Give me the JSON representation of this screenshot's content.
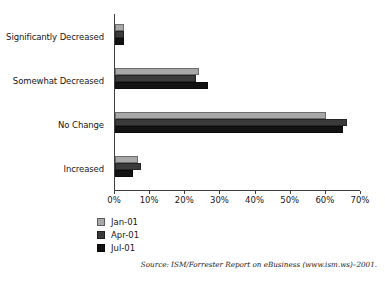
{
  "title_remnant": "________________________________________________",
  "chart_data": {
    "type": "bar",
    "orientation": "horizontal",
    "title": "",
    "xlabel": "",
    "ylabel": "",
    "xlim": [
      0,
      70
    ],
    "grid": false,
    "legend_position": "bottom-left",
    "categories": [
      "Increased",
      "No Change",
      "Somewhat Decreased",
      "Significantly Decreased"
    ],
    "x_tick_labels": [
      "0%",
      "10%",
      "20%",
      "30%",
      "40%",
      "50%",
      "60%",
      "70%"
    ],
    "x_tick_values": [
      0,
      10,
      20,
      30,
      40,
      50,
      60,
      70
    ],
    "series": [
      {
        "name": "Jan-01",
        "color": "#a8a8a8",
        "values": [
          6.5,
          60,
          24,
          2.5
        ]
      },
      {
        "name": "Apr-01",
        "color": "#3a3a3a",
        "values": [
          7.5,
          66,
          23,
          2.5
        ]
      },
      {
        "name": "Jul-01",
        "color": "#121212",
        "values": [
          5,
          65,
          26.5,
          2.5
        ]
      }
    ]
  },
  "legend": {
    "items": [
      {
        "label": "Jan-01",
        "color": "#a8a8a8"
      },
      {
        "label": "Apr-01",
        "color": "#3a3a3a"
      },
      {
        "label": "Jul-01",
        "color": "#121212"
      }
    ]
  },
  "source": {
    "text": "Source: ISM/Forrester Report on eBusiness (www.ism.ws)–2001."
  }
}
